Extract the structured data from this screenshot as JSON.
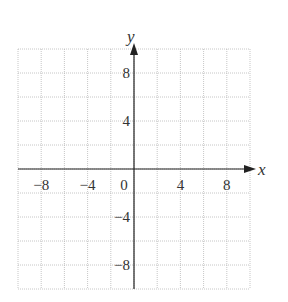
{
  "chart_data": {
    "type": "scatter",
    "title": "",
    "xlabel": "x",
    "ylabel": "y",
    "xlim": [
      -10,
      10
    ],
    "ylim": [
      -10,
      10
    ],
    "grid": true,
    "grid_step": 2,
    "x_ticks": [
      -8,
      -4,
      0,
      4,
      8
    ],
    "x_tick_labels": [
      "−8",
      "−4",
      "0",
      "4",
      "8"
    ],
    "y_ticks": [
      8,
      4,
      -4,
      -8
    ],
    "y_tick_labels": [
      "8",
      "4",
      "−4",
      "−8"
    ],
    "points": []
  }
}
